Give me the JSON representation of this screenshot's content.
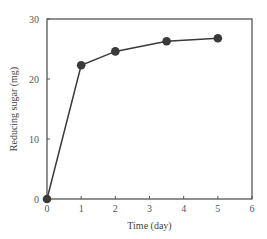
{
  "chart_data": {
    "type": "line",
    "title": "",
    "xlabel": "Time (day)",
    "ylabel": "Reducing sugar (mg)",
    "xlim": [
      0,
      6
    ],
    "ylim": [
      0,
      30
    ],
    "xticks": [
      0,
      1,
      2,
      3,
      4,
      5,
      6
    ],
    "yticks": [
      0,
      10,
      20,
      30
    ],
    "grid": false,
    "legend": null,
    "series": [
      {
        "name": "Reducing sugar",
        "marker": "filled-circle",
        "color": "#3a3a3a",
        "x": [
          0,
          1,
          2,
          3.5,
          5
        ],
        "y": [
          0,
          22.3,
          24.6,
          26.3,
          26.8
        ]
      }
    ]
  },
  "colors": {
    "axis": "#555555",
    "series": "#3a3a3a",
    "text": "#555555"
  }
}
